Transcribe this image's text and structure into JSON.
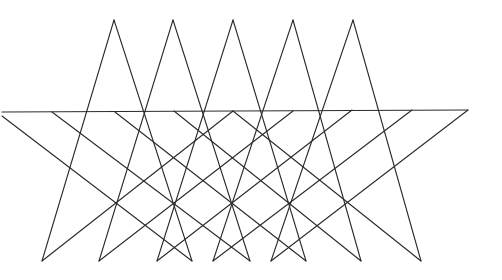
{
  "diagram": {
    "stroke_color": "#2a2a2a",
    "stroke_width": 1.1,
    "background": "#ffffff",
    "horizontal_line": {
      "x1": 2,
      "y1": 112,
      "x2": 468,
      "y2": 110
    },
    "triangles": [
      {
        "apex": [
          114,
          20
        ],
        "left": [
          42,
          261
        ],
        "right": [
          192,
          261
        ]
      },
      {
        "apex": [
          173,
          20
        ],
        "left": [
          99,
          261
        ],
        "right": [
          250,
          261
        ]
      },
      {
        "apex": [
          233,
          20
        ],
        "left": [
          157,
          261
        ],
        "right": [
          306,
          261
        ]
      },
      {
        "apex": [
          293,
          20
        ],
        "left": [
          213,
          261
        ],
        "right": [
          361,
          261
        ]
      },
      {
        "apex": [
          353,
          20
        ],
        "left": [
          271,
          261
        ],
        "right": [
          421,
          261
        ]
      }
    ],
    "descending_lines": [
      {
        "from": [
          2,
          116
        ],
        "to": [
          192,
          261
        ]
      },
      {
        "from": [
          52,
          112
        ],
        "to": [
          250,
          261
        ]
      },
      {
        "from": [
          115,
          112
        ],
        "to": [
          306,
          261
        ]
      },
      {
        "from": [
          174,
          111
        ],
        "to": [
          361,
          261
        ]
      },
      {
        "from": [
          233,
          111
        ],
        "to": [
          421,
          261
        ]
      }
    ],
    "ascending_lines": [
      {
        "from": [
          42,
          261
        ],
        "to": [
          233,
          111
        ]
      },
      {
        "from": [
          99,
          261
        ],
        "to": [
          293,
          111
        ]
      },
      {
        "from": [
          157,
          261
        ],
        "to": [
          352,
          110
        ]
      },
      {
        "from": [
          213,
          261
        ],
        "to": [
          412,
          110
        ]
      },
      {
        "from": [
          271,
          261
        ],
        "to": [
          468,
          110
        ]
      }
    ]
  }
}
